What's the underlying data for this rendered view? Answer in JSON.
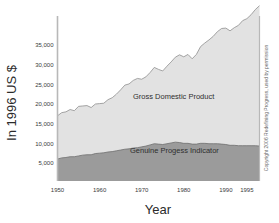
{
  "chart_data": {
    "type": "area",
    "title": "",
    "subtitle": "",
    "xlabel": "Year",
    "ylabel": "In 1996 US $",
    "stacked": true,
    "grid": false,
    "legend_position": "inline-annotation",
    "xlim": [
      1950,
      1998
    ],
    "ylim": [
      0,
      39000
    ],
    "xticks": [
      "1950",
      "1960",
      "1970",
      "1980",
      "1990",
      "1995"
    ],
    "xtick_values": [
      1950,
      1960,
      1970,
      1980,
      1990,
      1995
    ],
    "yticks": [
      "5,000",
      "10,000",
      "15,000",
      "20,000",
      "25,000",
      "30,000",
      "35,000"
    ],
    "ytick_values": [
      5000,
      10000,
      15000,
      20000,
      25000,
      30000,
      35000
    ],
    "x": [
      1950,
      1951,
      1952,
      1953,
      1954,
      1955,
      1956,
      1957,
      1958,
      1959,
      1960,
      1961,
      1962,
      1963,
      1964,
      1965,
      1966,
      1967,
      1968,
      1969,
      1970,
      1971,
      1972,
      1973,
      1974,
      1975,
      1976,
      1977,
      1978,
      1979,
      1980,
      1981,
      1982,
      1983,
      1984,
      1985,
      1986,
      1987,
      1988,
      1989,
      1990,
      1991,
      1992,
      1993,
      1994,
      1995,
      1996,
      1997,
      1998
    ],
    "series": [
      {
        "name": "Gross Domestic Product",
        "color": "#e2e2e2",
        "values": [
          17000,
          17800,
          18000,
          18600,
          18300,
          19400,
          19500,
          19600,
          19100,
          20000,
          20100,
          20200,
          21100,
          21600,
          22500,
          23600,
          24800,
          25100,
          26000,
          26500,
          26300,
          26900,
          28000,
          29300,
          28800,
          28400,
          29600,
          30700,
          31900,
          32500,
          32000,
          32600,
          31500,
          32600,
          34600,
          35500,
          36300,
          37200,
          38400,
          39200,
          39300,
          38600,
          39400,
          40000,
          41200,
          41700,
          42700,
          44000,
          45000
        ]
      },
      {
        "name": "Genuine Progess Indicator",
        "color": "#9b9b9b",
        "values": [
          6000,
          6300,
          6400,
          6600,
          6600,
          6800,
          7000,
          7100,
          7100,
          7400,
          7500,
          7600,
          7800,
          7900,
          8100,
          8300,
          8500,
          8600,
          8800,
          8900,
          9100,
          9300,
          9600,
          9900,
          9800,
          9700,
          9900,
          10100,
          10300,
          10200,
          10000,
          10000,
          9800,
          9800,
          10000,
          10000,
          9900,
          9900,
          9900,
          9800,
          9700,
          9500,
          9500,
          9400,
          9400,
          9400,
          9400,
          9400,
          9300
        ]
      }
    ]
  },
  "annotations": {
    "gdp_label": "Gross Domestic Product",
    "gpi_label": "Genuine Progess Indicator",
    "copyright": "Copyright 2006 Redefining Progress, used by permission"
  },
  "colors": {
    "gdp_fill": "#e2e2e2",
    "gpi_fill": "#9b9b9b",
    "axis_line": "#b5b5b5",
    "curve_line": "#8a8a8a",
    "text": "#2b2b2b"
  }
}
